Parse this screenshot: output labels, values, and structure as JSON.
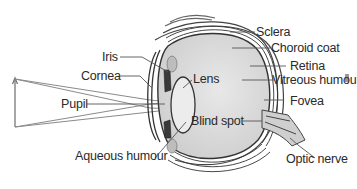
{
  "diagram": {
    "labels": {
      "iris": "Iris",
      "cornea": "Cornea",
      "pupil": "Pupil",
      "aqueous_humour": "Aqueous humour",
      "lens": "Lens",
      "sclera": "Sclera",
      "choroid_coat": "Choroid coat",
      "retina": "Retina",
      "vitreous_humour": "Vitreous humou",
      "fovea": "Fovea",
      "blind_spot": "Blind spot",
      "optic_nerve": "Optic nerve"
    },
    "colors": {
      "line": "#555555",
      "eyeball_fill": "#dcdcdc",
      "lens_fill": "#e6e6e6",
      "text": "#2a2a2a",
      "background": "#ffffff"
    }
  }
}
